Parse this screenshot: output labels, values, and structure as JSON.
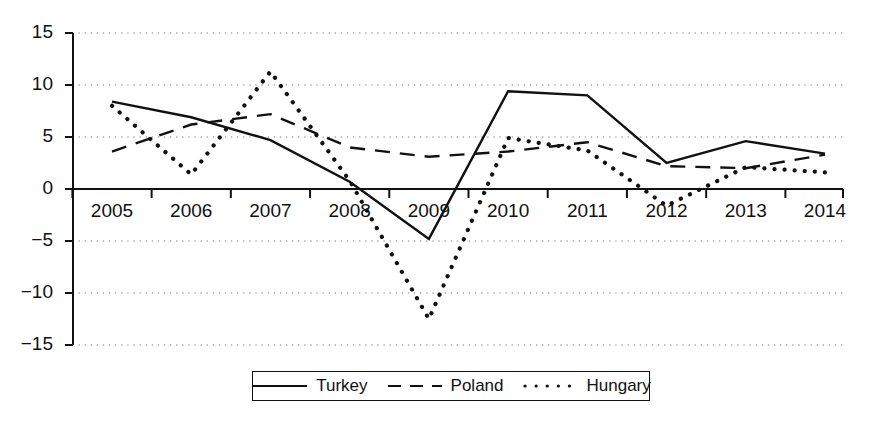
{
  "chart_data": {
    "type": "line",
    "title": "",
    "xlabel": "",
    "ylabel": "",
    "x": [
      2005,
      2006,
      2007,
      2008,
      2009,
      2010,
      2011,
      2012,
      2013,
      2014
    ],
    "categories": [
      "2005",
      "2006",
      "2007",
      "2008",
      "2009",
      "2010",
      "2011",
      "2012",
      "2013",
      "2014"
    ],
    "series": [
      {
        "name": "Turkey",
        "style": "solid",
        "color": "#111111",
        "values": [
          8.4,
          6.9,
          4.7,
          0.7,
          -4.8,
          9.4,
          9.0,
          2.5,
          4.6,
          3.4
        ]
      },
      {
        "name": "Poland",
        "style": "dashed",
        "color": "#111111",
        "values": [
          3.6,
          6.2,
          7.2,
          4.0,
          3.1,
          3.6,
          4.5,
          2.2,
          2.0,
          3.3
        ]
      },
      {
        "name": "Hungary",
        "style": "dotted",
        "color": "#111111",
        "values": [
          8.0,
          1.4,
          11.3,
          0.8,
          -12.5,
          4.9,
          3.7,
          -1.6,
          2.1,
          1.6
        ]
      }
    ],
    "ylim": [
      -15,
      15
    ],
    "yticks": [
      15,
      10,
      5,
      0,
      -5,
      -10,
      -15
    ],
    "ytick_labels": [
      "15",
      "10",
      "5",
      "0",
      "−5",
      "−10",
      "−15"
    ],
    "grid": true,
    "grid_style": "dotted-horizontal",
    "legend_position": "bottom-center",
    "legend": [
      "Turkey",
      "Poland",
      "Hungary"
    ]
  },
  "axes": {
    "y_axis_name": "value-axis",
    "x_axis_name": "year-axis"
  }
}
